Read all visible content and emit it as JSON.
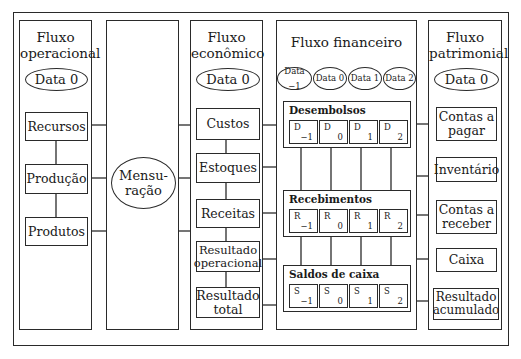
{
  "columns": {
    "operational": {
      "title_line1": "Fluxo",
      "title_line2": "operacional",
      "date": "Data 0",
      "nodes": [
        "Recursos",
        "Produção",
        "Produtos"
      ]
    },
    "measurement": {
      "ellipse_line1": "Mensu-",
      "ellipse_line2": "ração"
    },
    "economic": {
      "title_line1": "Fluxo",
      "title_line2": "econômico",
      "date": "Data 0",
      "nodes": [
        {
          "line1": "Custos",
          "line2": ""
        },
        {
          "line1": "Estoques",
          "line2": ""
        },
        {
          "line1": "Receitas",
          "line2": ""
        },
        {
          "line1": "Resultado",
          "line2": "operacional"
        },
        {
          "line1": "Resultado",
          "line2": "total"
        }
      ]
    },
    "financial": {
      "title": "Fluxo financeiro",
      "dates": [
        "Data −1",
        "Data 0",
        "Data 1",
        "Data 2"
      ],
      "groups": [
        {
          "title": "Desembolsos",
          "cells": [
            {
              "symbol": "D",
              "subscript": "−1"
            },
            {
              "symbol": "D",
              "subscript": "0"
            },
            {
              "symbol": "D",
              "subscript": "1"
            },
            {
              "symbol": "D",
              "subscript": "2"
            }
          ]
        },
        {
          "title": "Recebimentos",
          "cells": [
            {
              "symbol": "R",
              "subscript": "−1"
            },
            {
              "symbol": "R",
              "subscript": "0"
            },
            {
              "symbol": "R",
              "subscript": "1"
            },
            {
              "symbol": "R",
              "subscript": "2"
            }
          ]
        },
        {
          "title": "Saldos de caixa",
          "cells": [
            {
              "symbol": "S",
              "subscript": "−1"
            },
            {
              "symbol": "S",
              "subscript": "0"
            },
            {
              "symbol": "S",
              "subscript": "1"
            },
            {
              "symbol": "S",
              "subscript": "2"
            }
          ]
        }
      ]
    },
    "patrimonial": {
      "title_line1": "Fluxo",
      "title_line2": "patrimonial",
      "date": "Data 0",
      "nodes": [
        {
          "line1": "Contas a",
          "line2": "pagar"
        },
        {
          "line1": "Inventário",
          "line2": ""
        },
        {
          "line1": "Contas a",
          "line2": "receber"
        },
        {
          "line1": "Caixa",
          "line2": ""
        },
        {
          "line1": "Resultado",
          "line2": "acumulado"
        }
      ]
    }
  }
}
